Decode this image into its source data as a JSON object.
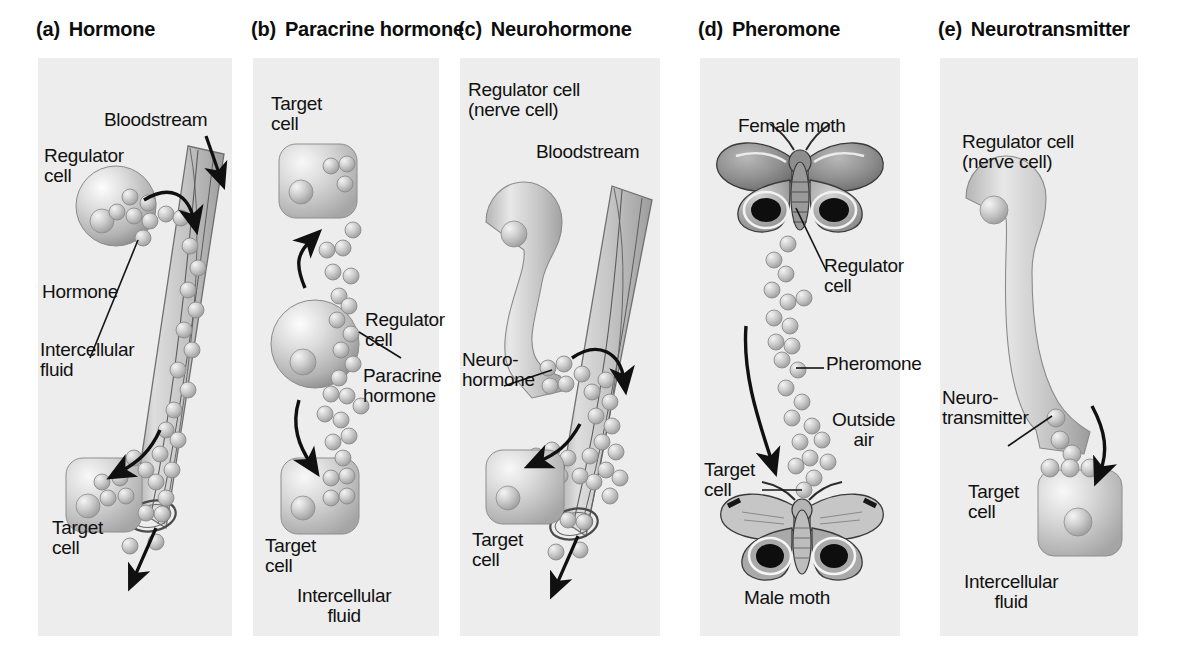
{
  "figure": {
    "type": "diagram",
    "background": "#ffffff",
    "panel_background": "#ededed"
  },
  "panels": [
    {
      "id": "a",
      "label": "(a)",
      "title": "Hormone",
      "labels": [
        {
          "name": "bloodstream",
          "text": "Bloodstream"
        },
        {
          "name": "regulator-cell",
          "text": "Regulator\ncell"
        },
        {
          "name": "hormone",
          "text": "Hormone"
        },
        {
          "name": "intercellular-fluid",
          "text": "Intercellular\nfluid"
        },
        {
          "name": "target-cell",
          "text": "Target\ncell"
        }
      ]
    },
    {
      "id": "b",
      "label": "(b)",
      "title": "Paracrine hormone",
      "labels": [
        {
          "name": "target-cell-top",
          "text": "Target\ncell"
        },
        {
          "name": "regulator-cell",
          "text": "Regulator\ncell"
        },
        {
          "name": "paracrine-hormone",
          "text": "Paracrine\nhormone"
        },
        {
          "name": "target-cell-bottom",
          "text": "Target\ncell"
        },
        {
          "name": "intercellular-fluid",
          "text": "Intercellular\nfluid"
        }
      ]
    },
    {
      "id": "c",
      "label": "(c)",
      "title": "Neurohormone",
      "labels": [
        {
          "name": "regulator-cell",
          "text": "Regulator cell\n(nerve cell)"
        },
        {
          "name": "bloodstream",
          "text": "Bloodstream"
        },
        {
          "name": "neurohormone",
          "text": "Neuro-\nhormone"
        },
        {
          "name": "target-cell",
          "text": "Target\ncell"
        }
      ]
    },
    {
      "id": "d",
      "label": "(d)",
      "title": "Pheromone",
      "labels": [
        {
          "name": "female-moth",
          "text": "Female moth"
        },
        {
          "name": "regulator-cell",
          "text": "Regulator\ncell"
        },
        {
          "name": "pheromone",
          "text": "Pheromone"
        },
        {
          "name": "outside-air",
          "text": "Outside\nair"
        },
        {
          "name": "target-cell",
          "text": "Target\ncell"
        },
        {
          "name": "male-moth",
          "text": "Male moth"
        }
      ]
    },
    {
      "id": "e",
      "label": "(e)",
      "title": "Neurotransmitter",
      "labels": [
        {
          "name": "regulator-cell",
          "text": "Regulator cell\n(nerve cell)"
        },
        {
          "name": "neurotransmitter",
          "text": "Neuro-\ntransmitter"
        },
        {
          "name": "target-cell",
          "text": "Target\ncell"
        },
        {
          "name": "intercellular-fluid",
          "text": "Intercellular\nfluid"
        }
      ]
    }
  ]
}
